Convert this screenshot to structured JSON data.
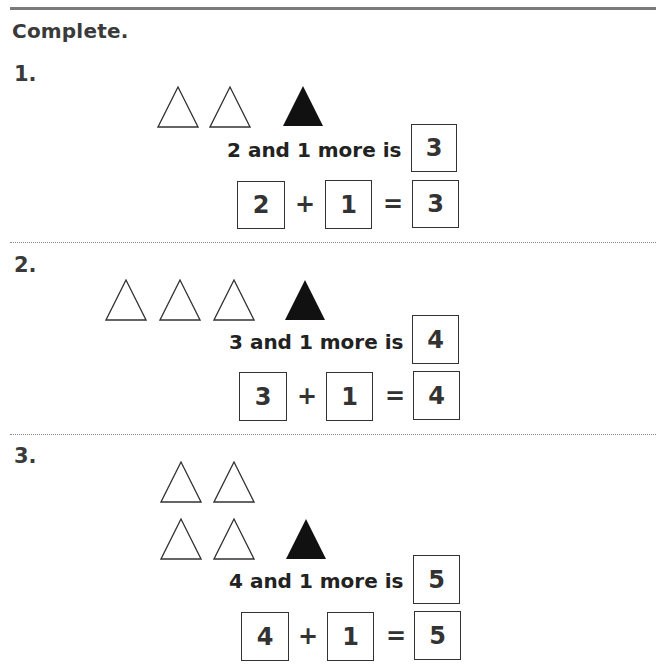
{
  "title": "Complete.",
  "problems": [
    {
      "number": "1.",
      "outline_triangles": 2,
      "filled_triangles": 1,
      "phrase": "2 and 1 more is",
      "phrase_answer": "3",
      "equation": {
        "addend1": "2",
        "plus": "+",
        "addend2": "1",
        "equals": "=",
        "sum": "3"
      }
    },
    {
      "number": "2.",
      "outline_triangles": 3,
      "filled_triangles": 1,
      "phrase": "3 and 1 more is",
      "phrase_answer": "4",
      "equation": {
        "addend1": "3",
        "plus": "+",
        "addend2": "1",
        "equals": "=",
        "sum": "4"
      }
    },
    {
      "number": "3.",
      "outline_triangles": 4,
      "filled_triangles": 1,
      "phrase": "4 and 1 more is",
      "phrase_answer": "5",
      "equation": {
        "addend1": "4",
        "plus": "+",
        "addend2": "1",
        "equals": "=",
        "sum": "5"
      }
    }
  ],
  "colors": {
    "text": "#2a2a2a",
    "filled_triangle": "#111111",
    "rule": "#7a7a7a"
  }
}
